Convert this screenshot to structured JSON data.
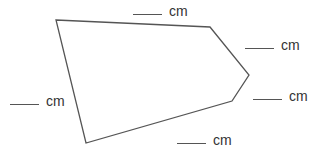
{
  "diagram": {
    "type": "pentagon-perimeter-worksheet",
    "stroke_color": "#555555",
    "vertices": [
      [
        56,
        20
      ],
      [
        210,
        27
      ],
      [
        249,
        75
      ],
      [
        232,
        101
      ],
      [
        86,
        143
      ]
    ],
    "sides": [
      {
        "id": "top",
        "blank": "",
        "unit": "cm",
        "pos": [
          133,
          2
        ]
      },
      {
        "id": "upper-right",
        "blank": "",
        "unit": "cm",
        "pos": [
          245,
          36
        ]
      },
      {
        "id": "lower-right",
        "blank": "",
        "unit": "cm",
        "pos": [
          253,
          87
        ]
      },
      {
        "id": "left",
        "blank": "",
        "unit": "cm",
        "pos": [
          10,
          92
        ]
      },
      {
        "id": "bottom",
        "blank": "",
        "unit": "cm",
        "pos": [
          177,
          131
        ]
      }
    ]
  }
}
